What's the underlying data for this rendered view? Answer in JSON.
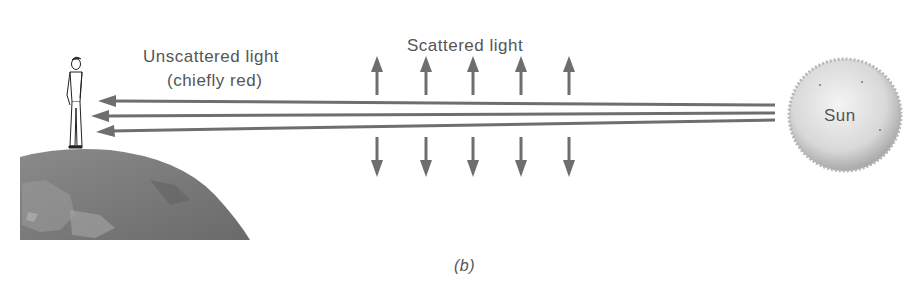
{
  "figure": {
    "panel_label": "(b)",
    "labels": {
      "unscattered_line1": "Unscattered light",
      "unscattered_line2": "(chiefly red)",
      "scattered": "Scattered light",
      "sun": "Sun"
    },
    "elements": {
      "observer": "person standing on Earth",
      "earth": "curved Earth surface",
      "sun": "Sun sphere",
      "unscattered_arrows": 3,
      "scattered_up_arrows": 5,
      "scattered_down_arrows": 5
    },
    "colors": {
      "arrow": "#6e6e6e",
      "text": "#555555",
      "earth": "#7a7a7a",
      "sun": "#d9d9d9"
    }
  }
}
